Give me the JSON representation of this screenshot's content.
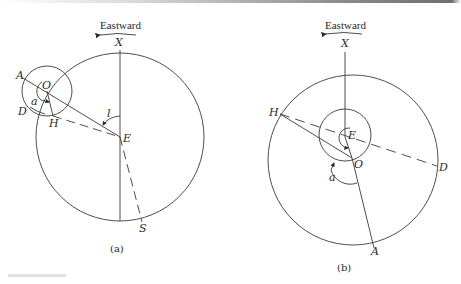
{
  "figure": {
    "panels": [
      {
        "id": "a",
        "caption": "(a)",
        "direction_label": "Eastward",
        "points": {
          "X": "X",
          "A": "A",
          "O": "O",
          "D": "D",
          "H": "H",
          "E": "E",
          "S": "S"
        },
        "angles": {
          "a": "a",
          "l": "l"
        }
      },
      {
        "id": "b",
        "caption": "(b)",
        "direction_label": "Eastward",
        "points": {
          "X": "X",
          "H": "H",
          "E": "E",
          "O": "O",
          "D": "D",
          "A": "A"
        },
        "angles": {
          "a": "a"
        }
      }
    ],
    "colors": {
      "stroke": "#3a3a3a",
      "text": "#2a2a2a",
      "background": "#ffffff"
    }
  }
}
